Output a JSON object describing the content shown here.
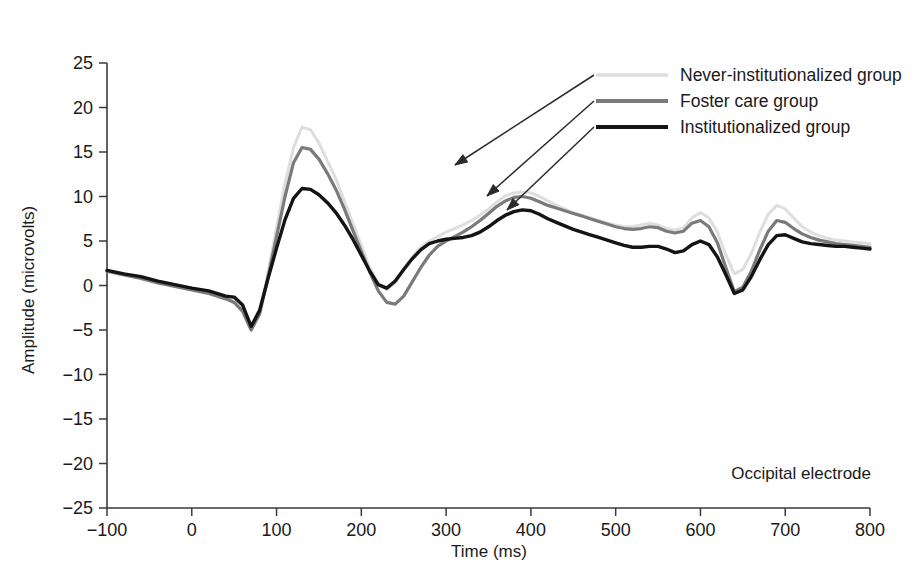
{
  "chart_data": {
    "type": "line",
    "title": "",
    "subtitle": "",
    "xlabel": "Time (ms)",
    "ylabel": "Amplitude (microvolts)",
    "xlim": [
      -100,
      800
    ],
    "ylim": [
      -25,
      25
    ],
    "grid": false,
    "legend_position": "top-right",
    "annotation": "Occipital electrode",
    "xticks": [
      -100,
      0,
      100,
      200,
      300,
      400,
      500,
      600,
      700,
      800
    ],
    "xtick_labels": [
      "−100",
      "0",
      "100",
      "200",
      "300",
      "400",
      "500",
      "600",
      "700",
      "800"
    ],
    "yticks": [
      -25,
      -20,
      -15,
      -10,
      -5,
      0,
      5,
      10,
      15,
      20,
      25
    ],
    "ytick_labels": [
      "−25",
      "−20",
      "−15",
      "−10",
      "−5",
      "0",
      "5",
      "10",
      "15",
      "20",
      "25"
    ],
    "x": [
      -100,
      -80,
      -60,
      -40,
      -20,
      0,
      20,
      40,
      50,
      60,
      70,
      80,
      90,
      100,
      110,
      120,
      130,
      140,
      150,
      160,
      170,
      180,
      190,
      200,
      210,
      220,
      230,
      240,
      250,
      260,
      270,
      280,
      290,
      300,
      310,
      320,
      330,
      340,
      350,
      360,
      370,
      380,
      390,
      400,
      410,
      420,
      430,
      440,
      450,
      460,
      470,
      480,
      490,
      500,
      510,
      520,
      530,
      540,
      550,
      560,
      570,
      580,
      590,
      600,
      610,
      620,
      630,
      640,
      650,
      660,
      670,
      680,
      690,
      700,
      710,
      720,
      730,
      740,
      750,
      760,
      770,
      780,
      790,
      800
    ],
    "series": [
      {
        "name": "Never-institutionalized group",
        "color": "#dedede",
        "linewidth": 3.0,
        "values": [
          1.7,
          1.3,
          0.9,
          0.4,
          0.0,
          -0.4,
          -0.7,
          -1.3,
          -1.6,
          -2.6,
          -4.8,
          -3.0,
          1.5,
          6.5,
          11.5,
          15.5,
          17.8,
          17.5,
          16.0,
          14.0,
          12.0,
          9.5,
          7.0,
          4.5,
          2.0,
          0.2,
          -0.5,
          0.3,
          1.8,
          3.2,
          4.3,
          5.0,
          5.5,
          6.0,
          6.4,
          6.8,
          7.3,
          7.9,
          8.6,
          9.4,
          10.1,
          10.4,
          10.5,
          10.4,
          10.0,
          9.5,
          9.0,
          8.6,
          8.2,
          7.9,
          7.6,
          7.3,
          7.0,
          6.8,
          6.6,
          6.6,
          6.8,
          7.0,
          6.8,
          6.4,
          6.2,
          6.5,
          7.6,
          8.2,
          7.6,
          6.0,
          3.4,
          1.3,
          1.8,
          3.6,
          6.0,
          8.0,
          9.0,
          8.6,
          7.6,
          6.6,
          6.0,
          5.6,
          5.3,
          5.1,
          5.0,
          4.9,
          4.8,
          4.7
        ]
      },
      {
        "name": "Foster care group",
        "color": "#7a7a7a",
        "linewidth": 3.2,
        "values": [
          1.6,
          1.2,
          0.8,
          0.3,
          -0.1,
          -0.5,
          -0.9,
          -1.5,
          -1.9,
          -2.9,
          -5.0,
          -3.2,
          1.0,
          5.5,
          10.0,
          13.8,
          15.5,
          15.3,
          14.2,
          12.6,
          10.8,
          8.6,
          6.2,
          3.8,
          1.5,
          -0.6,
          -1.9,
          -2.1,
          -1.2,
          0.4,
          2.0,
          3.4,
          4.4,
          5.0,
          5.5,
          6.0,
          6.6,
          7.3,
          8.1,
          8.9,
          9.5,
          9.9,
          10.0,
          9.8,
          9.4,
          9.0,
          8.7,
          8.4,
          8.1,
          7.8,
          7.5,
          7.2,
          6.9,
          6.6,
          6.4,
          6.3,
          6.4,
          6.6,
          6.5,
          6.1,
          5.9,
          6.1,
          7.0,
          7.3,
          6.6,
          4.8,
          2.0,
          -0.7,
          -0.2,
          1.6,
          4.0,
          6.1,
          7.3,
          7.1,
          6.4,
          5.8,
          5.4,
          5.1,
          4.9,
          4.7,
          4.6,
          4.5,
          4.4,
          4.3
        ]
      },
      {
        "name": "Institutionalized group",
        "color": "#141414",
        "linewidth": 3.4,
        "values": [
          1.7,
          1.3,
          1.0,
          0.5,
          0.1,
          -0.3,
          -0.6,
          -1.2,
          -1.3,
          -2.2,
          -4.6,
          -2.8,
          0.8,
          4.2,
          7.4,
          9.8,
          10.9,
          10.8,
          10.2,
          9.3,
          8.2,
          6.8,
          5.2,
          3.4,
          1.6,
          0.1,
          -0.3,
          0.5,
          1.8,
          3.0,
          4.0,
          4.7,
          5.0,
          5.2,
          5.3,
          5.4,
          5.6,
          6.0,
          6.6,
          7.3,
          7.9,
          8.3,
          8.5,
          8.4,
          8.0,
          7.5,
          7.1,
          6.7,
          6.3,
          6.0,
          5.7,
          5.4,
          5.1,
          4.8,
          4.5,
          4.3,
          4.3,
          4.4,
          4.4,
          4.1,
          3.7,
          3.9,
          4.6,
          5.0,
          4.6,
          3.2,
          1.2,
          -0.9,
          -0.5,
          1.0,
          2.9,
          4.6,
          5.6,
          5.7,
          5.3,
          4.9,
          4.7,
          4.6,
          4.5,
          4.4,
          4.4,
          4.3,
          4.2,
          4.1
        ]
      }
    ]
  },
  "axes": {
    "y_title": "Amplitude (microvolts)",
    "x_title": "Time (ms)"
  },
  "legend": {
    "items": [
      {
        "label": "Never-institutionalized group",
        "color": "#dedede"
      },
      {
        "label": "Foster care group",
        "color": "#7a7a7a"
      },
      {
        "label": "Institutionalized group",
        "color": "#141414"
      }
    ]
  },
  "annotations": {
    "electrode": "Occipital electrode"
  }
}
